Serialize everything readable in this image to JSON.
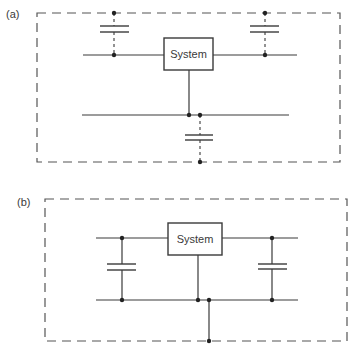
{
  "colors": {
    "line": "#3a3a3a",
    "dash": "#555555",
    "background": "#ffffff"
  },
  "panel_a": {
    "label": "(a)",
    "system_label": "System",
    "description": "System with capacitors connected between wires and the boundary (dashed)"
  },
  "panel_b": {
    "label": "(b)",
    "system_label": "System",
    "description": "System with capacitors connected between the two wires, bottom wire grounded to boundary"
  }
}
